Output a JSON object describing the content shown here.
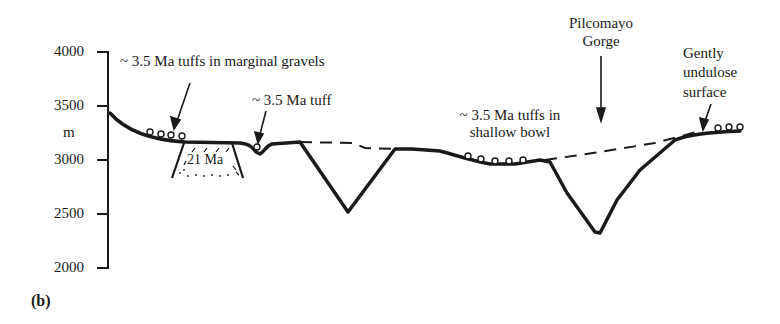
{
  "figure": {
    "panel_label": "(b)",
    "y_axis": {
      "unit": "m",
      "ticks": [
        "4000",
        "3500",
        "3000",
        "2500",
        "2000"
      ],
      "range": [
        2000,
        4000
      ]
    },
    "annotations": {
      "marginal_gravels": "~ 3.5 Ma tuffs in marginal gravels",
      "single_tuff": "~ 3.5 Ma tuff",
      "basement_age": "21 Ma",
      "shallow_bowl_line1": "~ 3.5 Ma tuffs in",
      "shallow_bowl_line2": "shallow bowl",
      "gorge_line1": "Pilcomayo",
      "gorge_line2": "Gorge",
      "surface_line1": "Gently",
      "surface_line2": "undulose",
      "surface_line3": "surface"
    },
    "colors": {
      "ink": "#1a1a1a",
      "background": "#ffffff"
    }
  }
}
